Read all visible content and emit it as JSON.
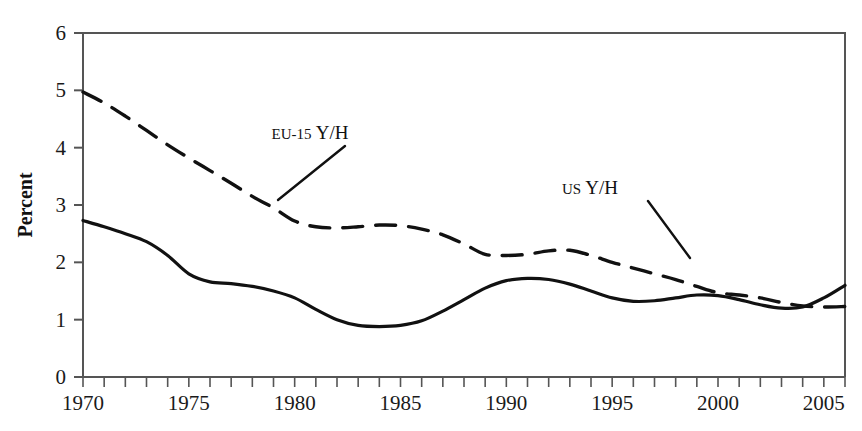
{
  "chart_data": {
    "type": "line",
    "title": "",
    "subtitle": "",
    "xlabel": "",
    "ylabel": "Percent",
    "xlim": [
      1970,
      2006
    ],
    "ylim": [
      0,
      6
    ],
    "yticks": [
      0,
      1,
      2,
      3,
      4,
      5,
      6
    ],
    "ytick_labels": [
      "0",
      "1",
      "2",
      "3",
      "4",
      "5",
      "6"
    ],
    "xticks": [
      1970,
      1971,
      1972,
      1973,
      1974,
      1975,
      1976,
      1977,
      1978,
      1979,
      1980,
      1981,
      1982,
      1983,
      1984,
      1985,
      1986,
      1987,
      1988,
      1989,
      1990,
      1991,
      1992,
      1993,
      1994,
      1995,
      1996,
      1997,
      1998,
      1999,
      2000,
      2001,
      2002,
      2003,
      2004,
      2005,
      2006
    ],
    "xtick_labels_shown": [
      "1970",
      "1975",
      "1980",
      "1985",
      "1990",
      "1995",
      "2000",
      "2005"
    ],
    "xtick_labels_values": [
      1970,
      1975,
      1980,
      1985,
      1990,
      1995,
      2000,
      2005
    ],
    "grid": false,
    "legend_position": "inline-annotation",
    "x": [
      1970,
      1971,
      1972,
      1973,
      1974,
      1975,
      1976,
      1977,
      1978,
      1979,
      1980,
      1981,
      1982,
      1983,
      1984,
      1985,
      1986,
      1987,
      1988,
      1989,
      1990,
      1991,
      1992,
      1993,
      1994,
      1995,
      1996,
      1997,
      1998,
      1999,
      2000,
      2001,
      2002,
      2003,
      2004,
      2005,
      2006
    ],
    "series": [
      {
        "name": "EU-15 Y/H",
        "style": "dashed",
        "color": "#111111",
        "values": [
          4.97,
          4.78,
          4.55,
          4.3,
          4.05,
          3.82,
          3.6,
          3.38,
          3.15,
          2.95,
          2.72,
          2.62,
          2.6,
          2.62,
          2.65,
          2.64,
          2.58,
          2.48,
          2.32,
          2.14,
          2.12,
          2.14,
          2.2,
          2.21,
          2.12,
          2.0,
          1.9,
          1.8,
          1.7,
          1.58,
          1.47,
          1.43,
          1.38,
          1.3,
          1.24,
          1.22,
          1.23
        ]
      },
      {
        "name": "US Y/H",
        "style": "solid",
        "color": "#111111",
        "values": [
          2.73,
          2.62,
          2.5,
          2.36,
          2.12,
          1.8,
          1.66,
          1.63,
          1.58,
          1.5,
          1.38,
          1.18,
          1.0,
          0.9,
          0.88,
          0.9,
          0.98,
          1.15,
          1.35,
          1.55,
          1.68,
          1.72,
          1.7,
          1.62,
          1.5,
          1.38,
          1.32,
          1.33,
          1.38,
          1.43,
          1.42,
          1.35,
          1.26,
          1.2,
          1.22,
          1.38,
          1.6
        ]
      }
    ],
    "annotations": [
      {
        "name": "eu-15-label",
        "text": "EU-15 Y/H",
        "small_caps_prefix": "EU-15",
        "roman_suffix": " Y/H",
        "text_x": 310,
        "text_y": 139,
        "leader_from": [
          345,
          146
        ],
        "leader_to": [
          278,
          200
        ]
      },
      {
        "name": "us-label",
        "text": "US Y/H",
        "small_caps_prefix": "US",
        "roman_suffix": " Y/H",
        "text_x": 590,
        "text_y": 194,
        "leader_from": [
          648,
          201
        ],
        "leader_to": [
          690,
          258
        ]
      }
    ]
  },
  "plot": {
    "left": 83,
    "right": 845,
    "top": 33,
    "bottom": 377,
    "series_end_year": 2006,
    "frame_color": "#555555",
    "line_color": "#111111"
  }
}
